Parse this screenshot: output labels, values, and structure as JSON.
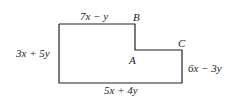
{
  "diagram": {
    "type": "polygon-figure",
    "stroke_color": "#222222",
    "outline_points": [
      [
        59,
        24
      ],
      [
        135,
        24
      ],
      [
        135,
        50
      ],
      [
        182,
        50
      ],
      [
        182,
        83
      ],
      [
        59,
        83
      ]
    ],
    "vertices": [
      {
        "name": "B",
        "label": "B"
      },
      {
        "name": "A",
        "label": "A"
      },
      {
        "name": "C",
        "label": "C"
      }
    ],
    "side_labels": {
      "top": "7x − y",
      "left": "3x + 5y",
      "right": "6x − 3y",
      "bottom": "5x + 4y"
    }
  }
}
